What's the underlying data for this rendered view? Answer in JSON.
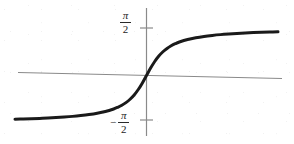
{
  "figure": {
    "name": "arctangent-graph",
    "background_color": "#ffffff",
    "width": 294,
    "height": 144
  },
  "chart_data": {
    "type": "line",
    "title": "",
    "subtitle": "",
    "xlabel": "",
    "ylabel": "",
    "function": "y = arctan(x)",
    "grid": false,
    "legend": null,
    "legend_position": "none",
    "xlim": [
      -8,
      8
    ],
    "ylim": [
      -2.2,
      2.2
    ],
    "axis_color": "#8a8a8a",
    "curve_color": "#1a1a1a",
    "curve_width_px": 3,
    "y_ticks": [
      {
        "value": 1.5707963,
        "label_numerator": "π",
        "label_denominator": "2",
        "sign": "",
        "pixel_y": 28
      },
      {
        "value": -1.5707963,
        "label_numerator": "π",
        "label_denominator": "2",
        "sign": "−",
        "pixel_y": 120
      }
    ],
    "x_ticks": [],
    "asymptotes": [
      {
        "name": "upper-asymptote",
        "value": 1.5707963,
        "label": "π/2"
      },
      {
        "name": "lower-asymptote",
        "value": -1.5707963,
        "label": "-π/2"
      }
    ],
    "x": [
      -8.0,
      -7.5,
      -7.0,
      -6.5,
      -6.0,
      -5.5,
      -5.0,
      -4.5,
      -4.0,
      -3.5,
      -3.0,
      -2.5,
      -2.0,
      -1.75,
      -1.5,
      -1.25,
      -1.0,
      -0.75,
      -0.5,
      -0.25,
      0.0,
      0.25,
      0.5,
      0.75,
      1.0,
      1.25,
      1.5,
      1.75,
      2.0,
      2.5,
      3.0,
      3.5,
      4.0,
      4.5,
      5.0,
      5.5,
      6.0,
      6.5,
      7.0,
      7.5,
      8.0
    ],
    "y": [
      -1.446,
      -1.438,
      -1.429,
      -1.418,
      -1.406,
      -1.391,
      -1.373,
      -1.352,
      -1.326,
      -1.293,
      -1.249,
      -1.19,
      -1.107,
      -1.052,
      -0.983,
      -0.896,
      -0.785,
      -0.644,
      -0.464,
      -0.245,
      0.0,
      0.245,
      0.464,
      0.644,
      0.785,
      0.896,
      0.983,
      1.052,
      1.107,
      1.19,
      1.249,
      1.293,
      1.326,
      1.352,
      1.373,
      1.391,
      1.406,
      1.418,
      1.429,
      1.438,
      1.446
    ],
    "series": [
      {
        "name": "arctan",
        "label": "y = arctan(x)",
        "color": "#1a1a1a",
        "values": [
          -1.446,
          -1.438,
          -1.429,
          -1.418,
          -1.406,
          -1.391,
          -1.373,
          -1.352,
          -1.326,
          -1.293,
          -1.249,
          -1.19,
          -1.107,
          -1.052,
          -0.983,
          -0.896,
          -0.785,
          -0.644,
          -0.464,
          -0.245,
          0.0,
          0.245,
          0.464,
          0.644,
          0.785,
          0.896,
          0.983,
          1.052,
          1.107,
          1.19,
          1.249,
          1.293,
          1.326,
          1.352,
          1.373,
          1.391,
          1.406,
          1.418,
          1.429,
          1.438,
          1.446
        ]
      }
    ]
  },
  "labels": {
    "upper_tick": {
      "sign": "",
      "numerator": "π",
      "denominator": "2"
    },
    "lower_tick": {
      "sign": "−",
      "numerator": "π",
      "denominator": "2"
    }
  }
}
